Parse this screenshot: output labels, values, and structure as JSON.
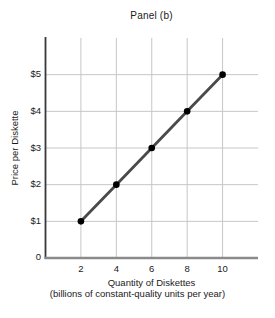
{
  "chart_data": {
    "type": "line",
    "title": "Panel (b)",
    "xlabel": "Quantity of Diskettes",
    "xlabel_sub": "(billions of constant-quality units per year)",
    "ylabel": "Price per Diskette",
    "points": [
      {
        "x": 2,
        "y": 1
      },
      {
        "x": 4,
        "y": 2
      },
      {
        "x": 6,
        "y": 3
      },
      {
        "x": 8,
        "y": 4
      },
      {
        "x": 10,
        "y": 5
      }
    ],
    "xlim": [
      0,
      12
    ],
    "ylim": [
      0,
      6
    ],
    "x_ticks": [
      2,
      4,
      6,
      8,
      10
    ],
    "x_ticklabels": [
      "2",
      "4",
      "6",
      "8",
      "10"
    ],
    "y_ticks": [
      1,
      2,
      3,
      4,
      5
    ],
    "y_ticklabels": [
      "$1",
      "$2",
      "$3",
      "$4",
      "$5"
    ],
    "origin_label": "0",
    "grid": true,
    "legend": null,
    "colors": {
      "line": "#4a4a4a",
      "marker": "#000000",
      "grid": "#c6c6c6",
      "y_axis": "#383838",
      "x_axis": "#8a8a8a",
      "background": "#ffffff",
      "text": "#1a1a1a"
    }
  }
}
